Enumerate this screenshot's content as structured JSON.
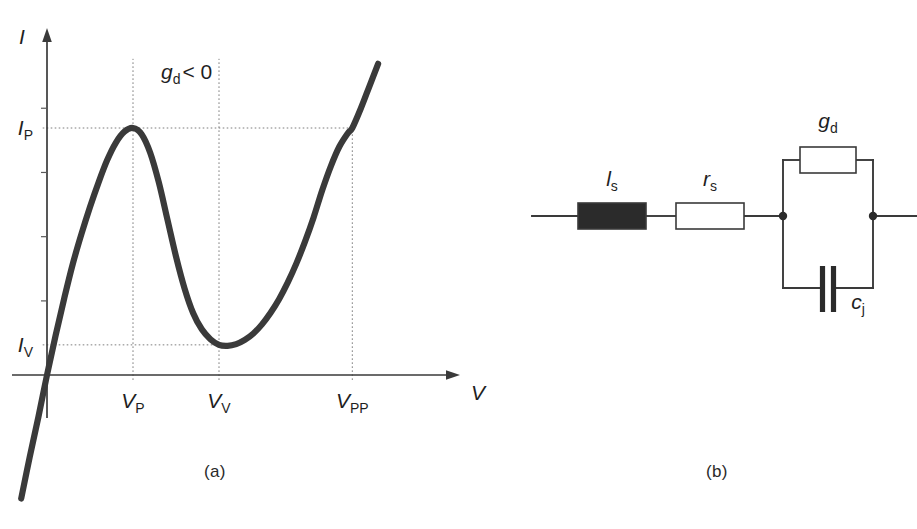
{
  "figure": {
    "panels": [
      {
        "id": "a",
        "caption": "(a)",
        "kind": "chart"
      },
      {
        "id": "b",
        "caption": "(b)",
        "kind": "circuit"
      }
    ],
    "page_artifact_text": ""
  },
  "chart_data": {
    "type": "line",
    "title": "",
    "xlabel": "V",
    "ylabel": "I",
    "grid": false,
    "legend": null,
    "annotations": [
      {
        "name": "negative-conductance",
        "var": "g",
        "sub": "d",
        "op": "< 0",
        "text": "gd < 0",
        "x": 0.32,
        "y": 0.93
      }
    ],
    "xticks": [
      {
        "label": "VP",
        "var": "V",
        "sub": "P",
        "value": 1.0
      },
      {
        "label": "VV",
        "var": "V",
        "sub": "V",
        "value": 2.0
      },
      {
        "label": "VPP",
        "var": "V",
        "sub": "PP",
        "value": 3.55
      }
    ],
    "yticks": [
      {
        "label": "IP",
        "var": "I",
        "sub": "P",
        "value": 1.0
      },
      {
        "label": "IV",
        "var": "I",
        "sub": "V",
        "value": 0.12
      }
    ],
    "xlim": [
      -0.35,
      4.05
    ],
    "ylim": [
      -0.52,
      1.32
    ],
    "series": [
      {
        "name": "tunnel-diode-iv-curve",
        "color": "#3a3a3a",
        "points": [
          [
            -0.3,
            -0.5
          ],
          [
            -0.2,
            -0.33
          ],
          [
            -0.1,
            -0.17
          ],
          [
            0.0,
            0.0
          ],
          [
            0.1,
            0.16
          ],
          [
            0.2,
            0.31
          ],
          [
            0.3,
            0.45
          ],
          [
            0.4,
            0.57
          ],
          [
            0.5,
            0.68
          ],
          [
            0.6,
            0.78
          ],
          [
            0.7,
            0.87
          ],
          [
            0.8,
            0.94
          ],
          [
            0.9,
            0.985
          ],
          [
            1.0,
            1.0
          ],
          [
            1.1,
            0.975
          ],
          [
            1.2,
            0.9
          ],
          [
            1.3,
            0.78
          ],
          [
            1.4,
            0.63
          ],
          [
            1.5,
            0.48
          ],
          [
            1.6,
            0.35
          ],
          [
            1.7,
            0.25
          ],
          [
            1.8,
            0.185
          ],
          [
            1.9,
            0.145
          ],
          [
            2.0,
            0.122
          ],
          [
            2.1,
            0.118
          ],
          [
            2.2,
            0.125
          ],
          [
            2.3,
            0.142
          ],
          [
            2.4,
            0.168
          ],
          [
            2.5,
            0.205
          ],
          [
            2.6,
            0.252
          ],
          [
            2.7,
            0.308
          ],
          [
            2.8,
            0.375
          ],
          [
            2.9,
            0.452
          ],
          [
            3.0,
            0.54
          ],
          [
            3.1,
            0.638
          ],
          [
            3.2,
            0.748
          ],
          [
            3.3,
            0.845
          ],
          [
            3.4,
            0.925
          ],
          [
            3.5,
            0.98
          ],
          [
            3.55,
            1.0
          ],
          [
            3.65,
            1.08
          ],
          [
            3.75,
            1.17
          ],
          [
            3.85,
            1.26
          ]
        ]
      }
    ],
    "guide_lines": [
      {
        "name": "ip-horizontal-guide",
        "type": "horizontal",
        "from_y": 1.0,
        "x_start": -0.05,
        "x_end": 3.55
      },
      {
        "name": "iv-horizontal-guide",
        "type": "horizontal",
        "from_y": 0.122,
        "x_start": -0.05,
        "x_end": 2.0
      },
      {
        "name": "vp-vertical-guide",
        "type": "vertical",
        "from_x": 1.0,
        "y_start": -0.02,
        "y_end": 1.28
      },
      {
        "name": "vv-vertical-guide",
        "type": "vertical",
        "from_x": 2.0,
        "y_start": -0.02,
        "y_end": 1.28
      },
      {
        "name": "vpp-vertical-guide",
        "type": "vertical",
        "from_x": 3.55,
        "y_start": -0.02,
        "y_end": 1.0
      }
    ]
  },
  "circuit": {
    "name": "tunnel-diode-equivalent-circuit",
    "line_color": "#3a3a3a",
    "components": [
      {
        "id": "ls",
        "kind": "inductor",
        "var": "l",
        "sub": "s",
        "label": "ls",
        "fill": "#2b2b2b",
        "series": true
      },
      {
        "id": "rs",
        "kind": "resistor",
        "var": "r",
        "sub": "s",
        "label": "rs",
        "fill": "#ffffff",
        "series": true
      },
      {
        "id": "gd",
        "kind": "conductance",
        "var": "g",
        "sub": "d",
        "label": "gd",
        "fill": "#ffffff",
        "series": false
      },
      {
        "id": "cj",
        "kind": "capacitor",
        "var": "c",
        "sub": "j",
        "label": "cj",
        "fill": "#2b2b2b",
        "series": false
      }
    ],
    "nodes": [
      {
        "id": "left-node",
        "label": ""
      },
      {
        "id": "right-node",
        "label": ""
      }
    ],
    "terminals": [
      {
        "id": "left-terminal",
        "label": ""
      },
      {
        "id": "right-terminal",
        "label": ""
      }
    ]
  }
}
